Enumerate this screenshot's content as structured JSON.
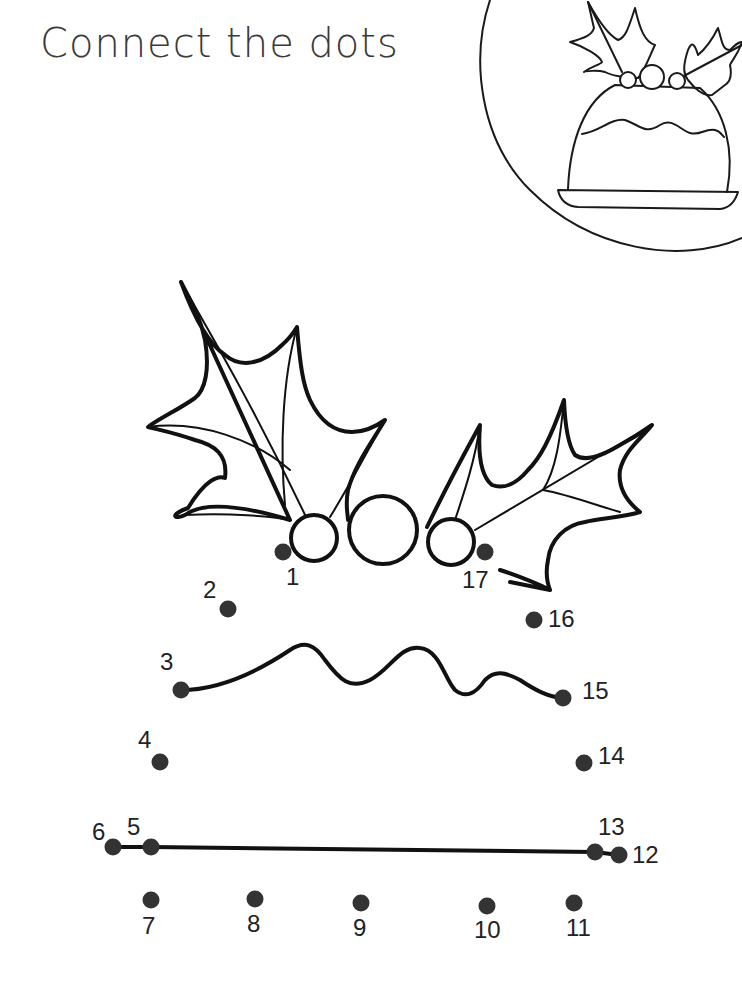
{
  "page": {
    "title": "Connect the dots",
    "ink_color": "#1a1a1a",
    "dot_color": "#333333"
  },
  "reference_image": {
    "subject": "christmas-pudding-with-holly",
    "frame": "circle"
  },
  "puzzle": {
    "subject": "christmas-pudding",
    "dots": [
      {
        "n": "1",
        "x": 283,
        "y": 552,
        "label_x": 286,
        "label_y": 565
      },
      {
        "n": "2",
        "x": 228,
        "y": 609,
        "label_x": 203,
        "label_y": 578
      },
      {
        "n": "3",
        "x": 181,
        "y": 690,
        "label_x": 160,
        "label_y": 650
      },
      {
        "n": "4",
        "x": 160,
        "y": 762,
        "label_x": 138,
        "label_y": 728
      },
      {
        "n": "5",
        "x": 151,
        "y": 847,
        "label_x": 127,
        "label_y": 815
      },
      {
        "n": "6",
        "x": 113,
        "y": 847,
        "label_x": 92,
        "label_y": 820
      },
      {
        "n": "7",
        "x": 151,
        "y": 900,
        "label_x": 142,
        "label_y": 914
      },
      {
        "n": "8",
        "x": 255,
        "y": 899,
        "label_x": 247,
        "label_y": 912
      },
      {
        "n": "9",
        "x": 361,
        "y": 903,
        "label_x": 353,
        "label_y": 916
      },
      {
        "n": "10",
        "x": 487,
        "y": 906,
        "label_x": 474,
        "label_y": 918
      },
      {
        "n": "11",
        "x": 574,
        "y": 903,
        "label_x": 566,
        "label_y": 916
      },
      {
        "n": "12",
        "x": 619,
        "y": 855,
        "label_x": 632,
        "label_y": 843
      },
      {
        "n": "13",
        "x": 595,
        "y": 852,
        "label_x": 598,
        "label_y": 815
      },
      {
        "n": "14",
        "x": 584,
        "y": 763,
        "label_x": 598,
        "label_y": 744
      },
      {
        "n": "15",
        "x": 563,
        "y": 698,
        "label_x": 582,
        "label_y": 679
      },
      {
        "n": "16",
        "x": 534,
        "y": 620,
        "label_x": 548,
        "label_y": 607
      },
      {
        "n": "17",
        "x": 485,
        "y": 552,
        "label_x": 462,
        "label_y": 568
      }
    ]
  }
}
